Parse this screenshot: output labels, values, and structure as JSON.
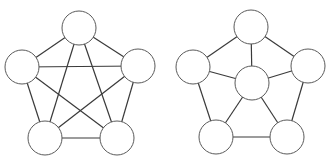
{
  "diagram": {
    "type": "graph-comparison",
    "style": {
      "edge_color": "#3a3a3a",
      "node_stroke": "#5a5a5a",
      "node_fill": "#ffffff",
      "background": "#ffffff",
      "node_radius": 17
    },
    "graphs": [
      {
        "name": "complete-graph-k5",
        "nodes": [
          {
            "id": "top",
            "x": 79,
            "y": 28
          },
          {
            "id": "left",
            "x": 22,
            "y": 67
          },
          {
            "id": "right",
            "x": 138,
            "y": 66
          },
          {
            "id": "bottom-left",
            "x": 45,
            "y": 138
          },
          {
            "id": "bottom-right",
            "x": 117,
            "y": 138
          }
        ],
        "edges": [
          [
            "top",
            "left"
          ],
          [
            "top",
            "right"
          ],
          [
            "top",
            "bottom-left"
          ],
          [
            "top",
            "bottom-right"
          ],
          [
            "left",
            "right"
          ],
          [
            "left",
            "bottom-left"
          ],
          [
            "left",
            "bottom-right"
          ],
          [
            "right",
            "bottom-left"
          ],
          [
            "right",
            "bottom-right"
          ],
          [
            "bottom-left",
            "bottom-right"
          ]
        ]
      },
      {
        "name": "wheel-graph-w6",
        "nodes": [
          {
            "id": "top",
            "x": 251,
            "y": 27
          },
          {
            "id": "left",
            "x": 193,
            "y": 67
          },
          {
            "id": "right",
            "x": 308,
            "y": 66
          },
          {
            "id": "center",
            "x": 252,
            "y": 83
          },
          {
            "id": "bottom-left",
            "x": 216,
            "y": 137
          },
          {
            "id": "bottom-right",
            "x": 287,
            "y": 137
          }
        ],
        "edges": [
          [
            "top",
            "left"
          ],
          [
            "top",
            "right"
          ],
          [
            "left",
            "bottom-left"
          ],
          [
            "right",
            "bottom-right"
          ],
          [
            "bottom-left",
            "bottom-right"
          ],
          [
            "center",
            "top"
          ],
          [
            "center",
            "left"
          ],
          [
            "center",
            "right"
          ],
          [
            "center",
            "bottom-left"
          ],
          [
            "center",
            "bottom-right"
          ]
        ]
      }
    ]
  }
}
